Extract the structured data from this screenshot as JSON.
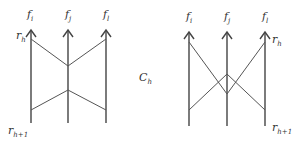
{
  "figure": {
    "left_diagram": {
      "top_labels": [
        {
          "base": "f",
          "sub": "i"
        },
        {
          "base": "f",
          "sub": "j"
        },
        {
          "base": "f",
          "sub": "l"
        }
      ],
      "row_top_label": {
        "base": "r",
        "sub": "h"
      },
      "row_bottom_label": {
        "base": "r",
        "sub": "h+1"
      }
    },
    "center_label": {
      "base": "C",
      "sub": "h"
    },
    "right_diagram": {
      "top_labels": [
        {
          "base": "f",
          "sub": "i"
        },
        {
          "base": "f",
          "sub": "j"
        },
        {
          "base": "f",
          "sub": "l"
        }
      ],
      "row_top_label": {
        "base": "r",
        "sub": "h"
      },
      "row_bottom_label": {
        "base": "r",
        "sub": "h+1"
      }
    },
    "colors": {
      "line": "#555555",
      "text": "#333333",
      "background": "#ffffff"
    }
  }
}
